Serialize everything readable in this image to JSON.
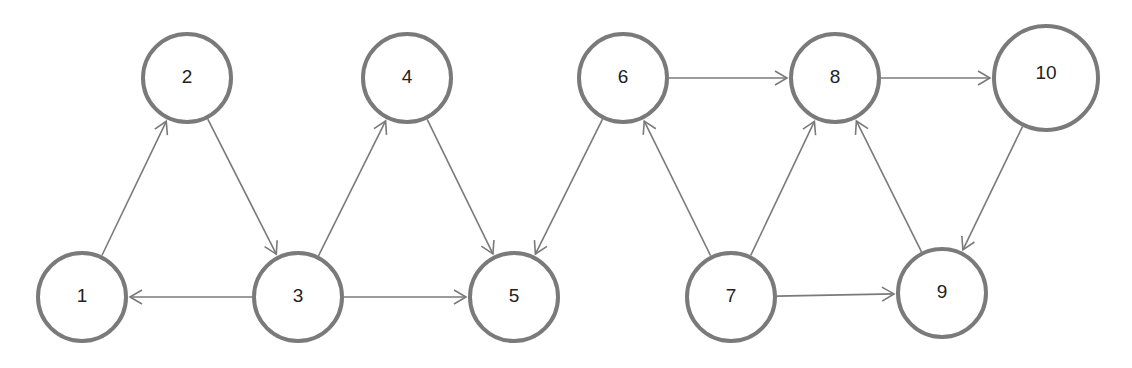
{
  "diagram": {
    "type": "directed-graph",
    "nodes": [
      {
        "id": "1",
        "label": "1"
      },
      {
        "id": "2",
        "label": "2"
      },
      {
        "id": "3",
        "label": "3"
      },
      {
        "id": "4",
        "label": "4"
      },
      {
        "id": "5",
        "label": "5"
      },
      {
        "id": "6",
        "label": "6"
      },
      {
        "id": "7",
        "label": "7"
      },
      {
        "id": "8",
        "label": "8"
      },
      {
        "id": "9",
        "label": "9"
      },
      {
        "id": "10",
        "label": "10"
      }
    ],
    "edges": [
      {
        "from": "1",
        "to": "2"
      },
      {
        "from": "2",
        "to": "3"
      },
      {
        "from": "3",
        "to": "1"
      },
      {
        "from": "3",
        "to": "4"
      },
      {
        "from": "3",
        "to": "5"
      },
      {
        "from": "4",
        "to": "5"
      },
      {
        "from": "6",
        "to": "5"
      },
      {
        "from": "6",
        "to": "8"
      },
      {
        "from": "7",
        "to": "6"
      },
      {
        "from": "7",
        "to": "8"
      },
      {
        "from": "7",
        "to": "9"
      },
      {
        "from": "9",
        "to": "8"
      },
      {
        "from": "8",
        "to": "10"
      },
      {
        "from": "10",
        "to": "9"
      }
    ],
    "colors": {
      "stroke": "#7a7a7a",
      "text": "#222222",
      "fill": "#ffffff"
    }
  }
}
